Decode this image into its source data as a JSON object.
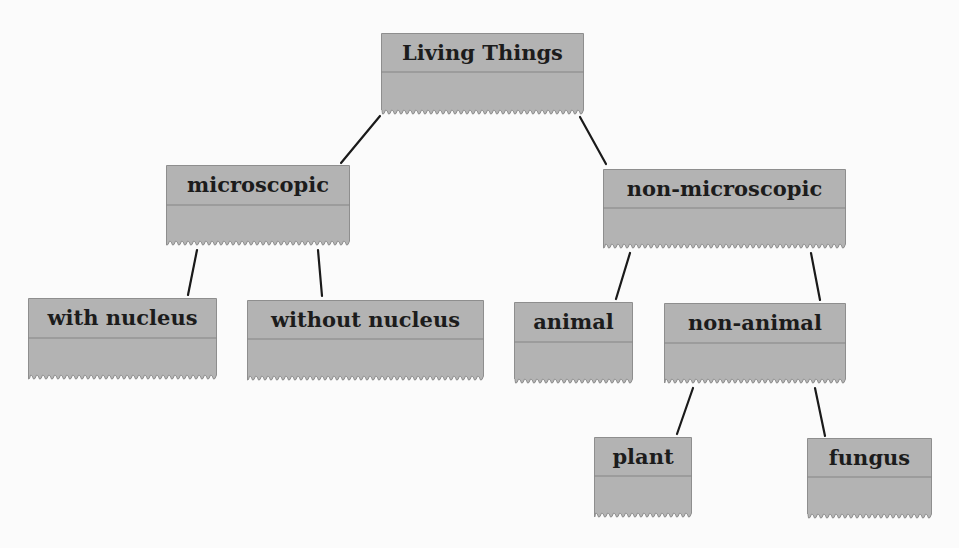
{
  "diagram": {
    "type": "hierarchy-tree",
    "colors": {
      "box_fill": "#b3b3b3",
      "box_edge": "#8e8e8e",
      "divider": "#858585",
      "line": "#1a1a1a",
      "text": "#1c1c1c",
      "background": "#fbfbfb"
    },
    "nodes": [
      {
        "id": "living-things",
        "label": "Living Things",
        "x": 381,
        "y": 33,
        "w": 203,
        "h": 80,
        "divider": 39,
        "font": 21
      },
      {
        "id": "microscopic",
        "label": "microscopic",
        "x": 166,
        "y": 165,
        "w": 184,
        "h": 79,
        "divider": 40,
        "font": 21
      },
      {
        "id": "non-microscopic",
        "label": "non-microscopic",
        "x": 603,
        "y": 169,
        "w": 243,
        "h": 78,
        "divider": 39,
        "font": 21
      },
      {
        "id": "with-nucleus",
        "label": "with nucleus",
        "x": 28,
        "y": 298,
        "w": 189,
        "h": 80,
        "divider": 40,
        "font": 21
      },
      {
        "id": "without-nucleus",
        "label": "without nucleus",
        "x": 247,
        "y": 300,
        "w": 237,
        "h": 79,
        "divider": 39,
        "font": 21
      },
      {
        "id": "animal",
        "label": "animal",
        "x": 514,
        "y": 302,
        "w": 119,
        "h": 80,
        "divider": 40,
        "font": 21
      },
      {
        "id": "non-animal",
        "label": "non-animal",
        "x": 664,
        "y": 303,
        "w": 182,
        "h": 79,
        "divider": 40,
        "font": 21
      },
      {
        "id": "plant",
        "label": "plant",
        "x": 594,
        "y": 437,
        "w": 98,
        "h": 79,
        "divider": 39,
        "font": 21
      },
      {
        "id": "fungus",
        "label": "fungus",
        "x": 807,
        "y": 438,
        "w": 125,
        "h": 79,
        "divider": 39,
        "font": 21
      }
    ],
    "edges": [
      {
        "from": "living-things",
        "to": "microscopic",
        "x1": 380,
        "y1": 116,
        "x2": 341,
        "y2": 163
      },
      {
        "from": "living-things",
        "to": "non-microscopic",
        "x1": 580,
        "y1": 117,
        "x2": 606,
        "y2": 164
      },
      {
        "from": "microscopic",
        "to": "with-nucleus",
        "x1": 197,
        "y1": 250,
        "x2": 188,
        "y2": 295
      },
      {
        "from": "microscopic",
        "to": "without-nucleus",
        "x1": 318,
        "y1": 250,
        "x2": 322,
        "y2": 296
      },
      {
        "from": "non-microscopic",
        "to": "animal",
        "x1": 630,
        "y1": 253,
        "x2": 616,
        "y2": 299
      },
      {
        "from": "non-microscopic",
        "to": "non-animal",
        "x1": 811,
        "y1": 253,
        "x2": 820,
        "y2": 300
      },
      {
        "from": "non-animal",
        "to": "plant",
        "x1": 693,
        "y1": 388,
        "x2": 677,
        "y2": 434
      },
      {
        "from": "non-animal",
        "to": "fungus",
        "x1": 815,
        "y1": 388,
        "x2": 825,
        "y2": 436
      }
    ]
  }
}
